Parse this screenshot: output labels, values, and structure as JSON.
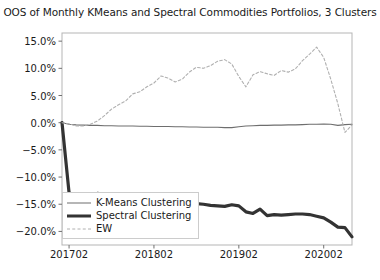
{
  "chart_data": {
    "type": "line",
    "title": "OOS of Monthly KMeans and Spectral Commodities Portfolios, 3 Clusters",
    "xlabel": "",
    "ylabel": "",
    "grid": false,
    "legend_position": "lower-left",
    "ylim": [
      -22.5,
      16.5
    ],
    "xlim": [
      0,
      41
    ],
    "ytick_values": [
      15.0,
      10.0,
      5.0,
      0.0,
      -5.0,
      -10.0,
      -15.0,
      -20.0
    ],
    "ytick_labels": [
      "15.0%",
      "10.0%",
      "5.0%",
      "0.0%",
      "-5.0%",
      "-10.0%",
      "-15.0%",
      "-20.0%"
    ],
    "xtick_positions": [
      1,
      13,
      25,
      37
    ],
    "xtick_labels": [
      "201702",
      "201802",
      "201902",
      "202002"
    ],
    "x": [
      0,
      1,
      2,
      3,
      4,
      5,
      6,
      7,
      8,
      9,
      10,
      11,
      12,
      13,
      14,
      15,
      16,
      17,
      18,
      19,
      20,
      21,
      22,
      23,
      24,
      25,
      26,
      27,
      28,
      29,
      30,
      31,
      32,
      33,
      34,
      35,
      36,
      37,
      38,
      39,
      40,
      41
    ],
    "series": [
      {
        "name": "K-Means Clustering",
        "style": "solid-thin",
        "color": "#6e6e6e",
        "values": [
          0.0,
          -0.3,
          -0.4,
          -0.45,
          -0.5,
          -0.5,
          -0.55,
          -0.55,
          -0.6,
          -0.6,
          -0.6,
          -0.65,
          -0.65,
          -0.7,
          -0.7,
          -0.7,
          -0.75,
          -0.75,
          -0.8,
          -0.8,
          -0.85,
          -0.85,
          -0.85,
          -0.9,
          -0.9,
          -0.75,
          -0.6,
          -0.55,
          -0.5,
          -0.5,
          -0.45,
          -0.45,
          -0.4,
          -0.4,
          -0.35,
          -0.3,
          -0.3,
          -0.25,
          -0.3,
          -0.5,
          -0.35,
          -0.3
        ]
      },
      {
        "name": "Spectral Clustering",
        "style": "solid-thick",
        "color": "#333333",
        "values": [
          0.0,
          -12.9,
          -13.5,
          -13.6,
          -13.6,
          -13.0,
          -13.2,
          -14.3,
          -14.4,
          -13.6,
          -13.6,
          -15.1,
          -14.6,
          -13.9,
          -13.7,
          -13.8,
          -14.5,
          -14.3,
          -14.8,
          -14.9,
          -15.0,
          -15.2,
          -15.3,
          -15.4,
          -15.1,
          -15.3,
          -16.4,
          -16.7,
          -15.9,
          -17.1,
          -16.9,
          -17.0,
          -16.9,
          -16.8,
          -16.8,
          -16.9,
          -17.2,
          -17.5,
          -18.3,
          -19.2,
          -19.3,
          -21.0
        ]
      },
      {
        "name": "EW",
        "style": "dashed",
        "color": "#b0b0b0",
        "values": [
          0.0,
          -0.2,
          -0.6,
          -0.6,
          -0.3,
          0.3,
          1.3,
          2.5,
          3.3,
          4.0,
          5.3,
          5.7,
          6.6,
          7.3,
          8.6,
          8.2,
          7.5,
          8.0,
          9.3,
          10.2,
          10.0,
          10.5,
          11.3,
          11.6,
          10.8,
          8.5,
          6.6,
          8.8,
          9.4,
          9.0,
          8.7,
          9.6,
          9.3,
          9.9,
          11.4,
          12.6,
          13.9,
          12.0,
          8.0,
          3.5,
          -1.8,
          -0.4
        ]
      }
    ]
  },
  "legend": {
    "items": [
      {
        "label": "K-Means Clustering"
      },
      {
        "label": "Spectral Clustering"
      },
      {
        "label": "EW"
      }
    ]
  }
}
